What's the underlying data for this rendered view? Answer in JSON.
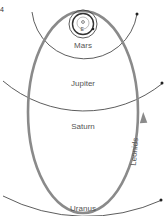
{
  "figure": {
    "corner_mark": "4"
  },
  "labels": {
    "sun_label": "",
    "earth_label": "E",
    "mars": "Mars",
    "jupiter": "Jupiter",
    "saturn": "Saturn",
    "uranus": "Uranus",
    "leonids": "Leonids"
  },
  "colors": {
    "background": "#ffffff",
    "leonids_orbit": "#8a8a8a",
    "planet_orbits": "#333333",
    "label_text": "#555555"
  }
}
